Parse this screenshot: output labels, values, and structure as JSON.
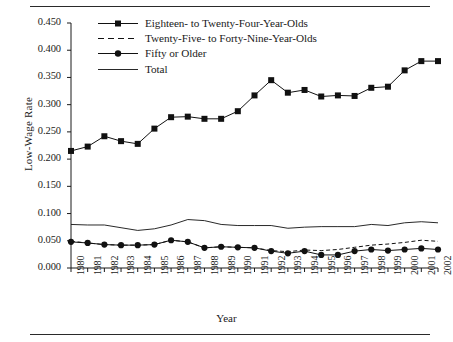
{
  "chart_data": {
    "type": "line",
    "title": "",
    "xlabel": "Year",
    "ylabel": "Low-Wage Rate",
    "grid": false,
    "legend_position": "top-left-inside",
    "xlim": [
      1980,
      2002
    ],
    "ylim": [
      0.0,
      0.45
    ],
    "ytick_labels": [
      "0.000",
      "0.050",
      "0.100",
      "0.150",
      "0.200",
      "0.250",
      "0.300",
      "0.350",
      "0.400",
      "0.450"
    ],
    "ytick_values": [
      0.0,
      0.05,
      0.1,
      0.15,
      0.2,
      0.25,
      0.3,
      0.35,
      0.4,
      0.45
    ],
    "categories": [
      1980,
      1981,
      1982,
      1983,
      1984,
      1985,
      1986,
      1987,
      1988,
      1989,
      1990,
      1991,
      1992,
      1993,
      1994,
      1995,
      1996,
      1997,
      1998,
      1999,
      2000,
      2001,
      2002
    ],
    "x": [
      "1980",
      "1981",
      "1982",
      "1983",
      "1984",
      "1985",
      "1986",
      "1987",
      "1988",
      "1989",
      "1990",
      "1991",
      "1992",
      "1993",
      "1994",
      "1995",
      "1996",
      "1997",
      "1998",
      "1999",
      "2000",
      "2001",
      "2002"
    ],
    "series": [
      {
        "name": "Eighteen- to Twenty-Four-Year-Olds",
        "style": "solid-square",
        "marker": "square",
        "color": "#111111",
        "values": [
          0.215,
          0.223,
          0.242,
          0.233,
          0.228,
          0.256,
          0.277,
          0.278,
          0.274,
          0.274,
          0.288,
          0.317,
          0.345,
          0.322,
          0.327,
          0.315,
          0.317,
          0.316,
          0.331,
          0.333,
          0.363,
          0.38,
          0.38
        ]
      },
      {
        "name": "Twenty-Five- to Forty-Nine-Year-Olds",
        "style": "dashed",
        "marker": "none",
        "color": "#111111",
        "values": [
          0.049,
          0.046,
          0.043,
          0.042,
          0.042,
          0.043,
          0.051,
          0.048,
          0.037,
          0.039,
          0.038,
          0.037,
          0.032,
          0.03,
          0.033,
          0.032,
          0.034,
          0.038,
          0.042,
          0.044,
          0.047,
          0.051,
          0.049
        ]
      },
      {
        "name": "Fifty or Older",
        "style": "solid-circle",
        "marker": "circle",
        "color": "#111111",
        "values": [
          0.048,
          0.046,
          0.043,
          0.042,
          0.042,
          0.043,
          0.051,
          0.048,
          0.037,
          0.039,
          0.038,
          0.037,
          0.031,
          0.027,
          0.031,
          0.024,
          0.024,
          0.031,
          0.034,
          0.032,
          0.034,
          0.036,
          0.034
        ]
      },
      {
        "name": "Total",
        "style": "solid-thin",
        "marker": "none",
        "color": "#111111",
        "values": [
          0.08,
          0.079,
          0.079,
          0.074,
          0.069,
          0.072,
          0.079,
          0.089,
          0.087,
          0.08,
          0.078,
          0.078,
          0.078,
          0.073,
          0.075,
          0.076,
          0.076,
          0.076,
          0.08,
          0.078,
          0.083,
          0.085,
          0.083
        ]
      }
    ]
  },
  "axes": {
    "ylabel": "Low-Wage Rate",
    "xlabel": "Year"
  },
  "legend": {
    "items": [
      {
        "label": "Eighteen- to Twenty-Four-Year-Olds",
        "key": "line-square-key"
      },
      {
        "label": "Twenty-Five- to Forty-Nine-Year-Olds",
        "key": "dashed-line-key"
      },
      {
        "label": "Fifty or Older",
        "key": "line-circle-key"
      },
      {
        "label": "Total",
        "key": "line-plain-key"
      }
    ]
  }
}
